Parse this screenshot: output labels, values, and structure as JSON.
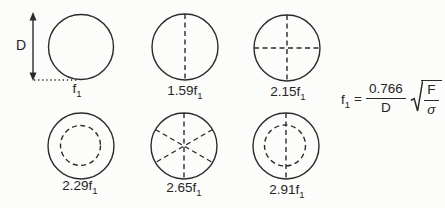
{
  "diagram": {
    "title_semantic": "vibration modes of a circular diaphragm",
    "dimension_label": "D",
    "modes": [
      {
        "name": "mode-1-fundamental",
        "pattern": "plain-circle",
        "label": "f",
        "sub": "1"
      },
      {
        "name": "mode-2",
        "pattern": "one-vertical-nodal-diameter",
        "label": "1.59f",
        "sub": "1"
      },
      {
        "name": "mode-3",
        "pattern": "two-crossed-nodal-diameters",
        "label": "2.15f",
        "sub": "1"
      },
      {
        "name": "mode-4",
        "pattern": "one-nodal-circle",
        "label": "2.29f",
        "sub": "1"
      },
      {
        "name": "mode-5",
        "pattern": "three-nodal-diameters-six-spokes",
        "label": "2.65f",
        "sub": "1"
      },
      {
        "name": "mode-6",
        "pattern": "nodal-circle-plus-vertical-diameter",
        "label": "2.91f",
        "sub": "1"
      }
    ],
    "formula": {
      "lhs": "f",
      "lhs_sub": "1",
      "equals": "=",
      "numerator": "0.766",
      "denominator": "D",
      "radicand_numerator": "F",
      "radicand_denominator": "σ"
    },
    "colors": {
      "ink": "#2b2b2b",
      "background": "#fcfcfa"
    }
  }
}
